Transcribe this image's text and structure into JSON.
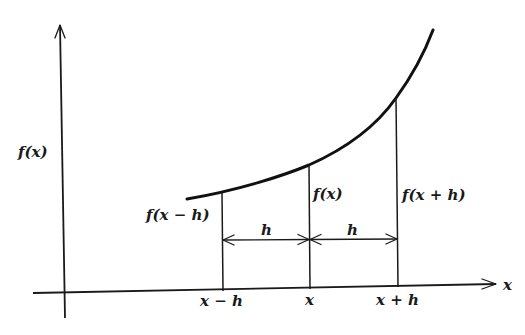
{
  "diagram": {
    "type": "finite-difference illustration",
    "colors": {
      "ink": "#1a1a1a",
      "background": "#ffffff"
    },
    "axes": {
      "y_label": "f(x)",
      "x_label": "x"
    },
    "x_ticks": [
      {
        "label": "x − h"
      },
      {
        "label": "x"
      },
      {
        "label": "x + h"
      }
    ],
    "ordinates": [
      {
        "label": "f(x − h)"
      },
      {
        "label": "f(x)"
      },
      {
        "label": "f(x + h)"
      }
    ],
    "spacings": [
      {
        "label": "h"
      },
      {
        "label": "h"
      }
    ]
  }
}
